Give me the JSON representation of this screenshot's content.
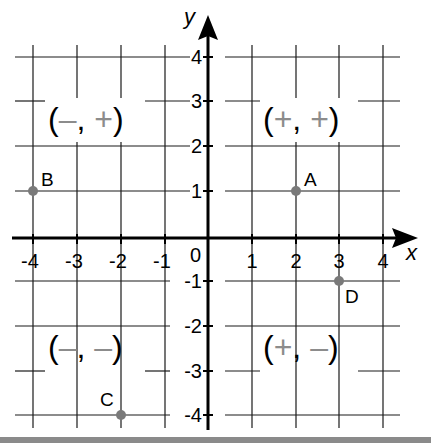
{
  "diagram": {
    "type": "coordinate-plane",
    "axes": {
      "x_label": "x",
      "y_label": "y",
      "x_range": [
        -4,
        4
      ],
      "y_range": [
        -4,
        4
      ],
      "origin_label": "0",
      "x_ticks": [
        "-4",
        "-3",
        "-2",
        "-1",
        "1",
        "2",
        "3",
        "4"
      ],
      "y_ticks": [
        "4",
        "3",
        "2",
        "1",
        "-1",
        "-2",
        "-3",
        "-4"
      ]
    },
    "quadrants": [
      {
        "name": "II",
        "open": "(",
        "first": "–",
        "comma": ",",
        "second": "+",
        "close": ")"
      },
      {
        "name": "I",
        "open": "(",
        "first": "+",
        "comma": ",",
        "second": "+",
        "close": ")"
      },
      {
        "name": "III",
        "open": "(",
        "first": "–",
        "comma": ",",
        "second": "–",
        "close": ")"
      },
      {
        "name": "IV",
        "open": "(",
        "first": "+",
        "comma": ",",
        "second": "–",
        "close": ")"
      }
    ],
    "points": [
      {
        "label": "A",
        "x": 2,
        "y": 1
      },
      {
        "label": "B",
        "x": -4,
        "y": 1
      },
      {
        "label": "C",
        "x": -2,
        "y": -4
      },
      {
        "label": "D",
        "x": 3,
        "y": -1
      }
    ],
    "colors": {
      "grid": "#1a1a1a",
      "axis": "#000000",
      "point": "#7a7a7a",
      "sign": "#8c8c8c",
      "bottom_bar": "#8a8a8a"
    }
  }
}
